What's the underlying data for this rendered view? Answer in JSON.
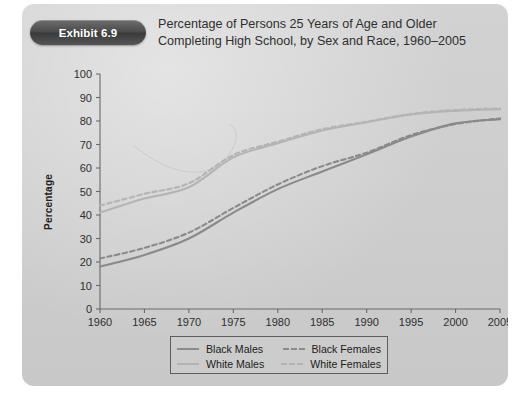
{
  "exhibit": {
    "badge_label": "Exhibit 6.9",
    "title_line_1": "Percentage of Persons 25 Years of Age and Older",
    "title_line_2": "Completing High School, by Sex and Race, 1960–2005"
  },
  "colors": {
    "panel_background": "#cecece",
    "badge_background": "#4a4a4a",
    "axis": "#6a6a6a",
    "black_series": "#8a8a8a",
    "white_series": "#b4b4b4",
    "text": "#2e2e2e"
  },
  "legend": {
    "position": "below-axis",
    "entries": [
      {
        "label": "Black Males",
        "style": "solid",
        "color": "#8a8a8a"
      },
      {
        "label": "Black Females",
        "style": "dashed",
        "color": "#8a8a8a"
      },
      {
        "label": "White Males",
        "style": "solid",
        "color": "#b4b4b4"
      },
      {
        "label": "White Females",
        "style": "dashed",
        "color": "#b4b4b4"
      }
    ]
  },
  "chart_data": {
    "type": "line",
    "title": "Percentage of Persons 25 Years of Age and Older Completing High School, by Sex and Race, 1960–2005",
    "xlabel": "",
    "ylabel": "Percentage",
    "xlim": [
      1960,
      2005
    ],
    "ylim": [
      0,
      100
    ],
    "grid": false,
    "legend_position": "below",
    "x_ticks": [
      1960,
      1965,
      1970,
      1975,
      1980,
      1985,
      1990,
      1995,
      2000,
      2005
    ],
    "y_ticks": [
      0,
      10,
      20,
      30,
      40,
      50,
      60,
      70,
      80,
      90,
      100
    ],
    "x": [
      1960,
      1965,
      1970,
      1975,
      1980,
      1985,
      1990,
      1995,
      2000,
      2005
    ],
    "series": [
      {
        "name": "Black Males",
        "style": "solid",
        "color": "#8a8a8a",
        "values": [
          18.0,
          23.0,
          30.0,
          41.0,
          51.0,
          58.5,
          65.8,
          73.4,
          79.0,
          80.8
        ]
      },
      {
        "name": "Black Females",
        "style": "dashed",
        "color": "#8a8a8a",
        "values": [
          21.5,
          26.0,
          32.5,
          43.0,
          53.0,
          60.8,
          66.5,
          74.0,
          78.7,
          81.1
        ]
      },
      {
        "name": "White Males",
        "style": "solid",
        "color": "#b4b4b4",
        "values": [
          41.0,
          47.0,
          51.8,
          64.5,
          70.5,
          76.0,
          79.5,
          82.8,
          84.3,
          85.0
        ]
      },
      {
        "name": "White Females",
        "style": "dashed",
        "color": "#b4b4b4",
        "values": [
          44.0,
          49.0,
          53.5,
          65.5,
          71.2,
          76.5,
          79.7,
          83.0,
          84.7,
          85.3
        ]
      }
    ]
  }
}
